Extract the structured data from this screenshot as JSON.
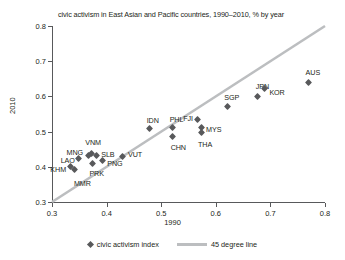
{
  "chart_data": {
    "type": "scatter",
    "title": "civic activism in East Asian and Pacific countries, 1990–2010, % by year",
    "xlabel": "1990",
    "ylabel": "2010",
    "xlim": [
      0.3,
      0.8
    ],
    "ylim": [
      0.3,
      0.8
    ],
    "xticks": [
      "0.3",
      "0.4",
      "0.5",
      "0.6",
      "0.7",
      "0.8"
    ],
    "yticks": [
      "0.3",
      "0.4",
      "0.5",
      "0.6",
      "0.7",
      "0.8"
    ],
    "grid": false,
    "legend_position": "bottom",
    "marker_color": "#58595b",
    "line_color": "#bcbec0",
    "points": [
      {
        "label": "MMR",
        "x": 0.342,
        "y": 0.392,
        "label_dx": -1,
        "label_dy": 14
      },
      {
        "label": "KHM",
        "x": 0.333,
        "y": 0.4,
        "label_dx": -23,
        "label_dy": 3
      },
      {
        "label": "LAO",
        "x": 0.349,
        "y": 0.424,
        "label_dx": -22,
        "label_dy": 3
      },
      {
        "label": "MNG",
        "x": 0.367,
        "y": 0.431,
        "label_dx": -22,
        "label_dy": -3
      },
      {
        "label": "VNM",
        "x": 0.372,
        "y": 0.437,
        "label_dx": -6,
        "label_dy": -11
      },
      {
        "label": "SLB",
        "x": 0.381,
        "y": 0.432,
        "label_dx": 5,
        "label_dy": -1
      },
      {
        "label": "PRK",
        "x": 0.374,
        "y": 0.41,
        "label_dx": -3,
        "label_dy": 11
      },
      {
        "label": "PNG",
        "x": 0.392,
        "y": 0.417,
        "label_dx": 5,
        "label_dy": 3
      },
      {
        "label": "VUT",
        "x": 0.43,
        "y": 0.43,
        "label_dx": 5,
        "label_dy": -1
      },
      {
        "label": "IDN",
        "x": 0.479,
        "y": 0.508,
        "label_dx": -3,
        "label_dy": -8
      },
      {
        "label": "CHN",
        "x": 0.521,
        "y": 0.487,
        "label_dx": -2,
        "label_dy": 12
      },
      {
        "label": "PHL",
        "x": 0.521,
        "y": 0.511,
        "label_dx": -3,
        "label_dy": -8
      },
      {
        "label": "FJI",
        "x": 0.566,
        "y": 0.534,
        "label_dx": -14,
        "label_dy": -1
      },
      {
        "label": "MYS",
        "x": 0.573,
        "y": 0.512,
        "label_dx": 5,
        "label_dy": 3
      },
      {
        "label": "THA",
        "x": 0.573,
        "y": 0.498,
        "label_dx": -3,
        "label_dy": 13
      },
      {
        "label": "SGP",
        "x": 0.621,
        "y": 0.57,
        "label_dx": -3,
        "label_dy": -9
      },
      {
        "label": "JPN",
        "x": 0.677,
        "y": 0.6,
        "label_dx": -2,
        "label_dy": -9
      },
      {
        "label": "KOR",
        "x": 0.689,
        "y": 0.623,
        "label_dx": 5,
        "label_dy": 5
      },
      {
        "label": "AUS",
        "x": 0.77,
        "y": 0.639,
        "label_dx": -3,
        "label_dy": -10
      }
    ],
    "reference_line": {
      "label": "45 degree line",
      "from": [
        0.3,
        0.3
      ],
      "to": [
        0.8,
        0.8
      ]
    },
    "series_label": "civic activism index"
  },
  "legend": {
    "points_label": "civic activism index",
    "line_label": "45 degree line"
  }
}
